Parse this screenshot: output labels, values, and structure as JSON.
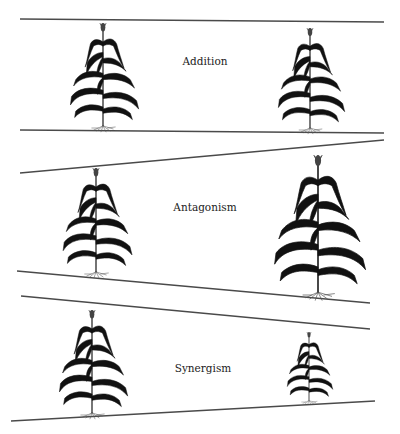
{
  "figure": {
    "background": "#ffffff",
    "line_color": "#4a4a4a",
    "panels": [
      {
        "id": "addition",
        "label": "Addition",
        "label_pos": [
          205,
          62
        ],
        "top_line": [
          [
            20,
            19
          ],
          [
            384,
            22
          ]
        ],
        "bottom_line": [
          [
            20,
            130
          ],
          [
            384,
            133
          ]
        ],
        "plants": [
          {
            "position": "left",
            "stem_x": 103,
            "top_y": 23,
            "base_y": 128,
            "size": "normal"
          },
          {
            "position": "right",
            "stem_x": 310,
            "top_y": 28,
            "base_y": 130,
            "size": "normal"
          }
        ]
      },
      {
        "id": "antagonism",
        "label": "Antagonism",
        "label_pos": [
          205,
          208
        ],
        "top_line": [
          [
            20,
            173
          ],
          [
            384,
            140
          ]
        ],
        "bottom_line": [
          [
            17,
            271
          ],
          [
            370,
            303
          ]
        ],
        "plants": [
          {
            "position": "left",
            "stem_x": 96,
            "top_y": 168,
            "base_y": 274,
            "size": "normal"
          },
          {
            "position": "right",
            "stem_x": 318,
            "top_y": 155,
            "base_y": 295,
            "size": "large"
          }
        ]
      },
      {
        "id": "synergism",
        "label": "Synergism",
        "label_pos": [
          203,
          369
        ],
        "top_line": [
          [
            21,
            296
          ],
          [
            370,
            329
          ]
        ],
        "bottom_line": [
          [
            11,
            421
          ],
          [
            375,
            401
          ]
        ],
        "plants": [
          {
            "position": "left",
            "stem_x": 92,
            "top_y": 310,
            "base_y": 415,
            "size": "normal"
          },
          {
            "position": "right",
            "stem_x": 309,
            "top_y": 332,
            "base_y": 402,
            "size": "small"
          }
        ]
      }
    ]
  }
}
